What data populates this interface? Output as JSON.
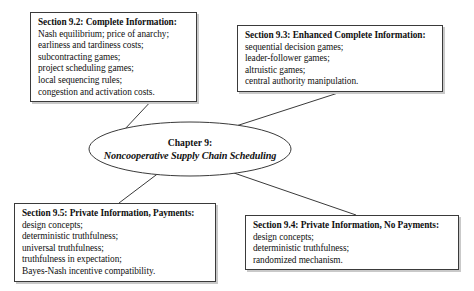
{
  "diagram": {
    "type": "chapter-structure-map",
    "center": {
      "line1": "Chapter 9:",
      "line2": "Noncooperative Supply Chain Scheduling"
    },
    "nodes": [
      {
        "id": "section-9-2",
        "title": "Section 9.2: Complete Information:",
        "lines": [
          "Nash equilibrium; price of anarchy;",
          "earliness and tardiness costs;",
          "subcontracting games;",
          "project scheduling games;",
          "local sequencing rules;",
          "congestion and activation costs."
        ]
      },
      {
        "id": "section-9-3",
        "title": "Section 9.3: Enhanced Complete Information:",
        "lines": [
          "sequential decision games;",
          "leader-follower games;",
          "altruistic games;",
          "central authority manipulation."
        ]
      },
      {
        "id": "section-9-5",
        "title": "Section 9.5: Private Information, Payments:",
        "lines": [
          "design concepts;",
          "deterministic truthfulness;",
          "universal truthfulness;",
          "truthfulness in expectation;",
          "Bayes-Nash incentive compatibility."
        ]
      },
      {
        "id": "section-9-4",
        "title": "Section 9.4: Private Information, No Payments:",
        "lines": [
          "design concepts;",
          "deterministic truthfulness;",
          "randomized mechanism."
        ]
      }
    ],
    "colors": {
      "line": "#3a3a3a",
      "shadow": "#c9c9c9",
      "background": "#ffffff",
      "text": "#101010"
    }
  }
}
